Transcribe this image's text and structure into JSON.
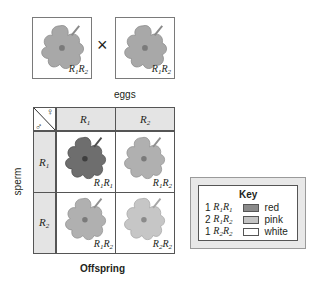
{
  "parents": {
    "left": {
      "genotype_a": "R",
      "sub_a": "1",
      "genotype_b": "R",
      "sub_b": "2",
      "flower_color": "#a8a8a8"
    },
    "cross_symbol": "×",
    "right": {
      "genotype_a": "R",
      "sub_a": "1",
      "genotype_b": "R",
      "sub_b": "2",
      "flower_color": "#a8a8a8"
    }
  },
  "punnett": {
    "eggs_label": "eggs",
    "sperm_label": "sperm",
    "corner": {
      "male_symbol": "♂",
      "female_symbol": "♀"
    },
    "columns": [
      {
        "allele": "R",
        "sub": "1"
      },
      {
        "allele": "R",
        "sub": "2"
      }
    ],
    "rows": [
      {
        "allele": "R",
        "sub": "1"
      },
      {
        "allele": "R",
        "sub": "2"
      }
    ],
    "cells": [
      [
        {
          "a": "R",
          "sa": "1",
          "b": "R",
          "sb": "1",
          "color": "#6e6e6e"
        },
        {
          "a": "R",
          "sa": "1",
          "b": "R",
          "sb": "2",
          "color": "#b0b0b0"
        }
      ],
      [
        {
          "a": "R",
          "sa": "1",
          "b": "R",
          "sb": "2",
          "color": "#b0b0b0"
        },
        {
          "a": "R",
          "sa": "2",
          "b": "R",
          "sb": "2",
          "color": "#c6c6c6"
        }
      ]
    ],
    "offspring_label": "Offspring"
  },
  "key": {
    "title": "Key",
    "items": [
      {
        "count": "1",
        "a": "R",
        "sa": "1",
        "b": "R",
        "sb": "1",
        "label": "red",
        "swatch": "#8a8a8a"
      },
      {
        "count": "2",
        "a": "R",
        "sa": "1",
        "b": "R",
        "sb": "2",
        "label": "pink",
        "swatch": "#c4c4c4"
      },
      {
        "count": "1",
        "a": "R",
        "sa": "2",
        "b": "R",
        "sb": "2",
        "label": "white",
        "swatch": "#ffffff"
      }
    ]
  }
}
